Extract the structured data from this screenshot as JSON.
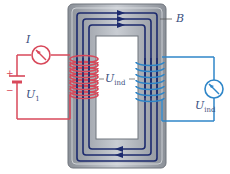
{
  "diagram": {
    "labels": {
      "current": "I",
      "magnetic_field": "B",
      "primary_voltage": "U",
      "primary_voltage_sub": "1",
      "induced_voltage_center": "U",
      "induced_voltage_center_sub": "ind",
      "induced_voltage_right": "U",
      "induced_voltage_right_sub": "ind",
      "plus": "+",
      "minus": "−"
    },
    "colors": {
      "primary_circuit": "#d8485a",
      "secondary_circuit": "#2f86c8",
      "flux_lines": "#1c2a6e",
      "core_gray": "#9aa0a8",
      "core_light": "#dfe2e6",
      "label_text": "#3a4f80"
    },
    "components": [
      "battery",
      "ammeter",
      "primary-coil",
      "iron-core",
      "secondary-coil",
      "voltmeter"
    ]
  }
}
